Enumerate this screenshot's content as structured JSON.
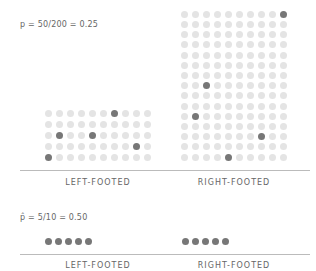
{
  "population": {
    "formula": "p = 50/200 = 0.25",
    "colors": {
      "light": "#e4e4e4",
      "dark": "#777777"
    },
    "groups": [
      {
        "label": "LEFT-FOOTED",
        "cols": 10,
        "rows": 5,
        "count": 50,
        "highlighted": [
          [
            0,
            6
          ],
          [
            2,
            1
          ],
          [
            2,
            4
          ],
          [
            3,
            8
          ],
          [
            4,
            0
          ]
        ]
      },
      {
        "label": "RIGHT-FOOTED",
        "cols": 10,
        "rows": 15,
        "count": 150,
        "highlighted": [
          [
            0,
            9
          ],
          [
            7,
            2
          ],
          [
            10,
            1
          ],
          [
            12,
            7
          ],
          [
            14,
            4
          ]
        ]
      }
    ]
  },
  "sample": {
    "formula": "p̂ = 5/10 = 0.50",
    "groups": [
      {
        "label": "LEFT-FOOTED",
        "count": 5
      },
      {
        "label": "RIGHT-FOOTED",
        "count": 5
      }
    ]
  }
}
